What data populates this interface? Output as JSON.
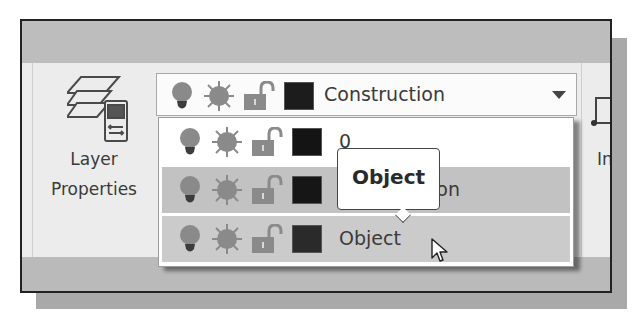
{
  "ribbon": {
    "layer_properties": {
      "label_line1": "Layer",
      "label_line2": "Properties",
      "icon": "layer-properties-icon"
    },
    "layer_combo": {
      "current_layer": "Construction",
      "current_color": "#1c1c1c",
      "icons": [
        "lightbulb-on-icon",
        "sun-thaw-icon",
        "unlock-icon",
        "color-swatch"
      ],
      "dropdown_icon": "chevron-down-icon"
    },
    "layer_list": {
      "items": [
        {
          "name": "0",
          "color": "#141414",
          "state": "normal"
        },
        {
          "name": "Construction",
          "color": "#161616",
          "state": "highlighted"
        },
        {
          "name": "Object",
          "color": "#2a2a2a",
          "state": "hover"
        }
      ]
    },
    "tooltip": {
      "text": "Object"
    },
    "next_panel": {
      "label_partial": "In"
    }
  },
  "colors": {
    "header_band": "#bdbdbd",
    "ribbon_body": "#ececec",
    "icon_grey": "#8c8c8c",
    "icon_dark": "#3a3a3a",
    "highlight_row": "#c2c2c2",
    "hover_row": "#cbcbcb"
  },
  "cursor": {
    "type": "arrow",
    "x": 433,
    "y": 240
  }
}
